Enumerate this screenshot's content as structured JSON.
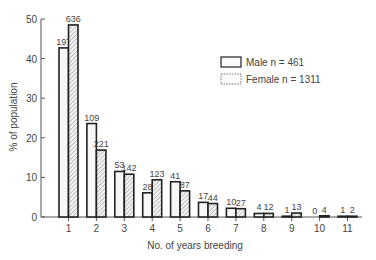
{
  "chart_data": {
    "type": "bar",
    "title": "",
    "xlabel": "No. of years breeding",
    "ylabel": "% of population",
    "ylim": [
      0,
      50
    ],
    "yticks": [
      0,
      10,
      20,
      30,
      40,
      50
    ],
    "grid": false,
    "legend_position": "upper right",
    "categories": [
      "1",
      "2",
      "3",
      "4",
      "5",
      "6",
      "7",
      "8",
      "9",
      "10",
      "11"
    ],
    "series": [
      {
        "name": "Male  n = 461",
        "pattern": "open",
        "values": [
          42.7,
          23.6,
          11.5,
          6.1,
          8.9,
          3.7,
          2.2,
          0.9,
          0.2,
          0.0,
          0.2
        ],
        "counts": [
          197,
          109,
          53,
          28,
          41,
          17,
          10,
          4,
          1,
          0,
          1
        ]
      },
      {
        "name": "Female  n = 1311",
        "pattern": "hatched",
        "values": [
          48.5,
          16.9,
          10.8,
          9.4,
          6.6,
          3.4,
          2.1,
          0.9,
          1.0,
          0.3,
          0.2
        ],
        "counts": [
          636,
          221,
          142,
          123,
          87,
          44,
          27,
          12,
          13,
          4,
          2
        ]
      }
    ]
  },
  "legend": {
    "male_label": "Male  n = 461",
    "female_label": "Female  n = 1311"
  },
  "colors": {
    "bar_stroke": "#222222",
    "axis": "#555555",
    "hatch": "#888888",
    "text": "#444444"
  }
}
